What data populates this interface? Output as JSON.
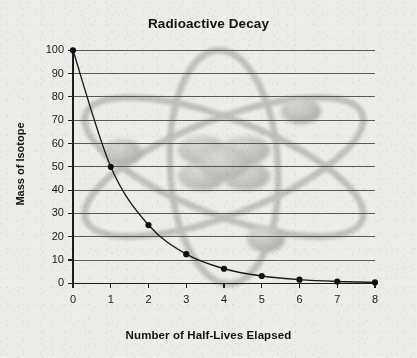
{
  "chart_data": {
    "type": "line",
    "title": "Radioactive Decay",
    "xlabel": "Number of Half-Lives Elapsed",
    "ylabel": "Mass of Isotope",
    "x": [
      0,
      1,
      2,
      3,
      4,
      5,
      6,
      7,
      8
    ],
    "values": [
      100,
      50,
      25,
      12.5,
      6.25,
      3.125,
      1.5625,
      0.78,
      0.39
    ],
    "series": [
      {
        "name": "Mass of Isotope",
        "values": [
          100,
          50,
          25,
          12.5,
          6.25,
          3.125,
          1.5625,
          0.78,
          0.39
        ]
      }
    ],
    "xlim": [
      0,
      8
    ],
    "ylim": [
      0,
      100
    ],
    "xticks": [
      "0",
      "1",
      "2",
      "3",
      "4",
      "5",
      "6",
      "7",
      "8"
    ],
    "yticks": [
      "0",
      "10",
      "20",
      "30",
      "40",
      "50",
      "60",
      "70",
      "80",
      "90",
      "100"
    ],
    "grid": "horizontal",
    "legend": "none",
    "marker": "filled-circle",
    "line_color": "#1a1a1a",
    "marker_color": "#111111",
    "grid_color": "#4d4d4d",
    "axis_color": "#222222",
    "background_color": "#ececeb",
    "watermark": "atom-diagram",
    "watermark_color": "#b9b9b7"
  },
  "watermark": {
    "name": "atom-diagram",
    "nucleus_label": "atom-nucleus",
    "orbit_labels": [
      "orbit-vertical",
      "orbit-diagonal-left",
      "orbit-diagonal-right"
    ],
    "electron_labels": [
      "electron-left",
      "electron-top-right",
      "electron-bottom"
    ]
  }
}
